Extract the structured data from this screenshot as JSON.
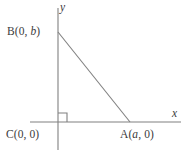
{
  "figure": {
    "type": "right-triangle-coordinate-diagram",
    "background_color": "#ffffff",
    "line_color": "#808080",
    "text_color": "#3b3b3b",
    "axes": {
      "x_axis_label": "x",
      "y_axis_label": "y"
    },
    "vertices": [
      {
        "key": "B",
        "label_prefix": "B(0, ",
        "label_var": "b",
        "label_suffix": ")",
        "full_label": "B(0, b)"
      },
      {
        "key": "C",
        "label_prefix": "C(0, ",
        "label_var": "0",
        "label_suffix": ")",
        "full_label": "C(0, 0)"
      },
      {
        "key": "A",
        "label_prefix": "A(",
        "label_var": "a",
        "label_suffix": ", 0)",
        "full_label": "A(a, 0)"
      }
    ],
    "right_angle_marker": "square-at-origin",
    "geometry": {
      "origin_px": {
        "x": 58,
        "y": 122
      },
      "x_axis_start_px": 30,
      "x_axis_end_px": 181,
      "y_axis_top_px": 8,
      "y_axis_bottom_px": 150,
      "point_B_px": {
        "x": 58,
        "y": 32
      },
      "point_A_px": {
        "x": 130,
        "y": 122
      },
      "right_angle_size_px": 9
    }
  }
}
